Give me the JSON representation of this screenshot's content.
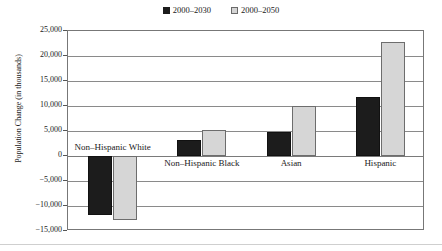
{
  "legend": {
    "position": "top-center",
    "entries": [
      {
        "label": "2000–2030",
        "marker": "filled-square-dark",
        "color": "#1c1c1c"
      },
      {
        "label": "2000–2050",
        "marker": "filled-square-light",
        "color": "#d6d6d6"
      }
    ]
  },
  "axis": {
    "ylabel": "Population Change (in thousands)",
    "yticks": [
      "25,000",
      "20,000",
      "15,000",
      "10,000",
      "5,000",
      "0",
      "−5,000",
      "−10,000",
      "−15,000"
    ],
    "ytick_values": [
      25000,
      20000,
      15000,
      10000,
      5000,
      0,
      -5000,
      -10000,
      -15000
    ]
  },
  "chart_data": {
    "type": "bar",
    "title": "",
    "subtitle": "",
    "xlabel": "",
    "ylabel": "Population Change (in thousands)",
    "ylim": [
      -15000,
      25000
    ],
    "ytick_step": 5000,
    "grid": true,
    "legend_position": "top-center",
    "categories": [
      "Non–Hispanic White",
      "Non–Hispanic Black",
      "Asian",
      "Hispanic"
    ],
    "series": [
      {
        "name": "2000–2030",
        "color": "#1c1c1c",
        "values": [
          -11800,
          3300,
          4900,
          11900
        ]
      },
      {
        "name": "2000–2050",
        "color": "#d6d6d6",
        "values": [
          -12700,
          5200,
          10000,
          22800
        ]
      }
    ],
    "annotations": [
      {
        "text": "Non–Hispanic White",
        "note": "category label placed above zero line because bars are negative"
      },
      {
        "text": "Non–Hispanic Black",
        "note": "category label below zero line"
      },
      {
        "text": "Asian",
        "note": "category label below zero line"
      },
      {
        "text": "Hispanic",
        "note": "category label below zero line"
      }
    ]
  }
}
